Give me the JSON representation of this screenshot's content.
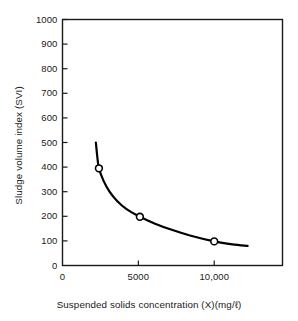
{
  "chart_data": {
    "type": "line",
    "title": "",
    "xlabel": "Suspended solids concentration (X)(mg/ℓ)",
    "ylabel": "Sludge volume index (SVI)",
    "xlim": [
      0,
      14500
    ],
    "ylim": [
      0,
      1000
    ],
    "grid": false,
    "legend": "none",
    "x_ticks": [
      {
        "value": 0,
        "label": "0"
      },
      {
        "value": 5000,
        "label": "5000"
      },
      {
        "value": 10000,
        "label": "10,000"
      }
    ],
    "y_ticks": [
      {
        "value": 0,
        "label": "0"
      },
      {
        "value": 100,
        "label": "100"
      },
      {
        "value": 200,
        "label": "200"
      },
      {
        "value": 300,
        "label": "300"
      },
      {
        "value": 400,
        "label": "400"
      },
      {
        "value": 500,
        "label": "500"
      },
      {
        "value": 600,
        "label": "600"
      },
      {
        "value": 700,
        "label": "700"
      },
      {
        "value": 800,
        "label": "800"
      },
      {
        "value": 900,
        "label": "900"
      },
      {
        "value": 1000,
        "label": "1000"
      }
    ],
    "series": [
      {
        "name": "SVI curve",
        "line_color": "#000000",
        "marker": "open-circle",
        "curve_points": [
          {
            "x": 2200,
            "y": 500
          },
          {
            "x": 2280,
            "y": 450
          },
          {
            "x": 2400,
            "y": 395
          },
          {
            "x": 2700,
            "y": 345
          },
          {
            "x": 3100,
            "y": 300
          },
          {
            "x": 3600,
            "y": 262
          },
          {
            "x": 4200,
            "y": 230
          },
          {
            "x": 5100,
            "y": 198
          },
          {
            "x": 6100,
            "y": 170
          },
          {
            "x": 7200,
            "y": 145
          },
          {
            "x": 8400,
            "y": 122
          },
          {
            "x": 10000,
            "y": 98
          },
          {
            "x": 11200,
            "y": 86
          },
          {
            "x": 12200,
            "y": 80
          }
        ],
        "data_points": [
          {
            "x": 2400,
            "y": 395
          },
          {
            "x": 5100,
            "y": 198
          },
          {
            "x": 10000,
            "y": 98
          }
        ]
      }
    ]
  }
}
